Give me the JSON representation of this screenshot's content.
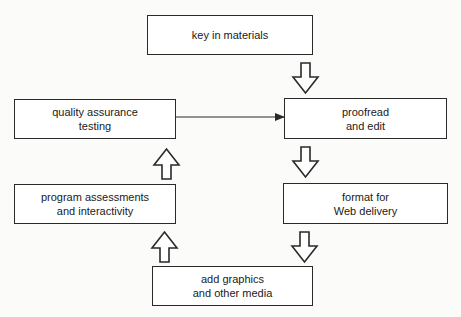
{
  "diagram": {
    "type": "flowchart",
    "nodes": [
      {
        "id": "key",
        "lines": [
          "key in materials"
        ]
      },
      {
        "id": "proofread",
        "lines": [
          "proofread",
          "and edit"
        ]
      },
      {
        "id": "format",
        "lines": [
          "format for",
          "Web delivery"
        ]
      },
      {
        "id": "graphics",
        "lines": [
          "add graphics",
          "and other media"
        ]
      },
      {
        "id": "program",
        "lines": [
          "program assessments",
          "and interactivity"
        ]
      },
      {
        "id": "qa",
        "lines": [
          "quality assurance",
          "testing"
        ]
      }
    ],
    "edges": [
      {
        "from": "key",
        "to": "proofread",
        "style": "block-arrow"
      },
      {
        "from": "proofread",
        "to": "format",
        "style": "block-arrow"
      },
      {
        "from": "format",
        "to": "graphics",
        "style": "block-arrow"
      },
      {
        "from": "graphics",
        "to": "program",
        "style": "block-arrow"
      },
      {
        "from": "program",
        "to": "qa",
        "style": "block-arrow"
      },
      {
        "from": "qa",
        "to": "proofread",
        "style": "line-arrow"
      }
    ],
    "colors": {
      "stroke": "#2a2a2a",
      "box_fill": "#ffffff",
      "background": "#fbfbfa"
    }
  }
}
